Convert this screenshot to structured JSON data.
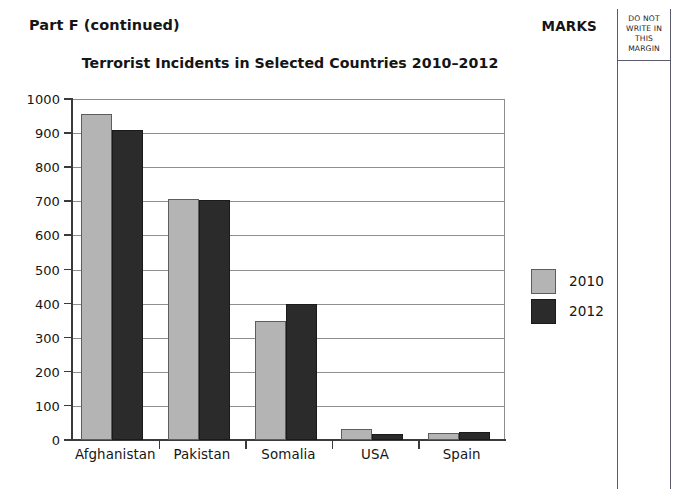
{
  "page": {
    "part_label": "Part F (continued)",
    "marks_label": "MARKS",
    "margin_note": [
      "DO NOT",
      "WRITE IN",
      "THIS",
      "MARGIN"
    ]
  },
  "colors": {
    "series_2010": "#b4b4b4",
    "series_2012": "#2b2b2b",
    "axis": "#3a3a3a",
    "grid": "#8f8f8f",
    "page_background": "#ffffff",
    "margin_rule": "#5a5a6a"
  },
  "chart_data": {
    "type": "bar",
    "title": "Terrorist Incidents in Selected Countries 2010–2012",
    "subtitle": "",
    "xlabel": "",
    "ylabel": "",
    "categories": [
      "Afghanistan",
      "Pakistan",
      "Somalia",
      "USA",
      "Spain"
    ],
    "series": [
      {
        "name": "2010",
        "color": "#b4b4b4",
        "values": [
          955,
          708,
          350,
          32,
          20
        ]
      },
      {
        "name": "2012",
        "color": "#2b2b2b",
        "values": [
          910,
          703,
          398,
          19,
          24
        ]
      }
    ],
    "ylim": [
      0,
      1000
    ],
    "ytick_labels": [
      "0",
      "100",
      "200",
      "300",
      "400",
      "500",
      "600",
      "700",
      "800",
      "900",
      "1000"
    ],
    "ytick_values": [
      0,
      100,
      200,
      300,
      400,
      500,
      600,
      700,
      800,
      900,
      1000
    ],
    "grid": true,
    "grid_axis": "y",
    "legend": [
      "2010",
      "2012"
    ],
    "legend_position": "right"
  }
}
